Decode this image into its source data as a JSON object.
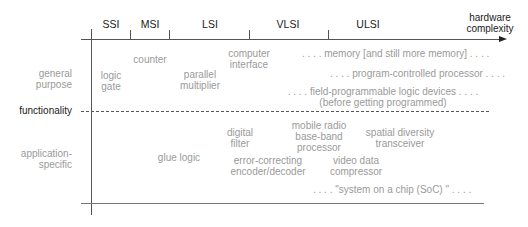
{
  "axis": {
    "x_label_line1": "hardware",
    "x_label_line2": "complexity",
    "y_label": "functionality"
  },
  "columns": [
    "SSI",
    "MSI",
    "LSI",
    "VLSI",
    "ULSI"
  ],
  "rows": {
    "general_line1": "general",
    "general_line2": "purpose",
    "app_line1": "application-",
    "app_line2": "specific"
  },
  "general_items": {
    "counter": "counter",
    "logic_gate_1": "logic",
    "logic_gate_2": "gate",
    "parallel_mult_1": "parallel",
    "parallel_mult_2": "multiplier",
    "computer_iface_1": "computer",
    "computer_iface_2": "interface",
    "memory": ". . . . memory [and still more memory] . . . .",
    "processor": ". . . . program-controlled processor . . . .",
    "fpga_1": ". . . . field-programmable logic devices . . . .",
    "fpga_2": "(before getting programmed)"
  },
  "specific_items": {
    "digital_filter_1": "digital",
    "digital_filter_2": "filter",
    "mobile_radio_1": "mobile radio",
    "mobile_radio_2": "base-band",
    "mobile_radio_3": "processor",
    "spatial_1": "spatial diversity",
    "spatial_2": "transceiver",
    "glue_logic": "glue logic",
    "ecc_1": "error-correcting",
    "ecc_2": "encoder/decoder",
    "video_1": "video data",
    "video_2": "compressor",
    "soc": ". . . . \"system on a chip (SoC) \" . . . ."
  }
}
